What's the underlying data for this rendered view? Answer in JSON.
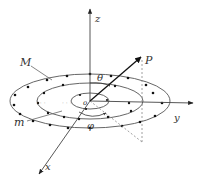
{
  "figure": {
    "colors": {
      "line": "#444444",
      "dot": "#111111",
      "dashed": "#888888",
      "text": "#333333"
    },
    "labels": {
      "z_axis": "z",
      "y_axis": "y",
      "x_axis": "x",
      "point": "P",
      "theta": "θ",
      "phi": "φ",
      "origin": "o",
      "outer_ring": "M",
      "inner_ring": "m",
      "ellipsis_outer": "· · ·",
      "ellipsis_inner": "· · ·"
    }
  }
}
